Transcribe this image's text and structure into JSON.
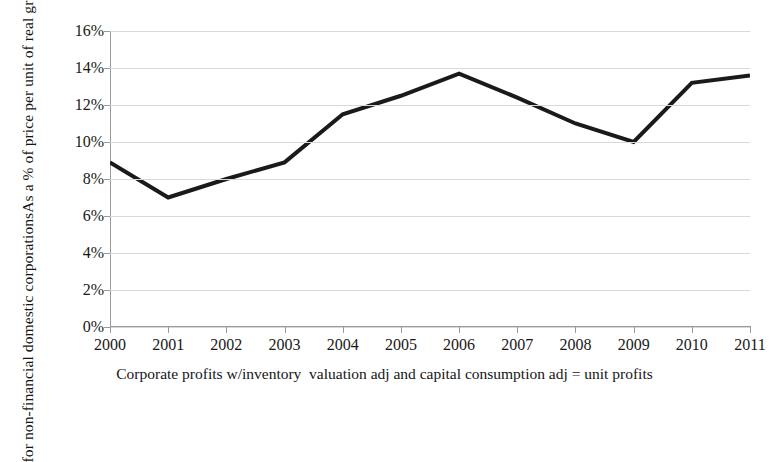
{
  "chart_data": {
    "type": "line",
    "title": "",
    "subtitle": "",
    "xlabel": "Corporate profits w/inventory  valuation adj and capital consumption adj = unit profits",
    "ylabel_line1": "As a % of price per unit of real gross value-added",
    "ylabel_line2": "for non-financial domestic corporations",
    "categories": [
      "2000",
      "2001",
      "2002",
      "2003",
      "2004",
      "2005",
      "2006",
      "2007",
      "2008",
      "2009",
      "2010",
      "2011"
    ],
    "x": [
      2000,
      2001,
      2002,
      2003,
      2004,
      2005,
      2006,
      2007,
      2008,
      2009,
      2010,
      2011
    ],
    "values": [
      8.9,
      7.0,
      8.0,
      8.9,
      11.5,
      12.5,
      13.7,
      12.4,
      11.0,
      10.0,
      13.2,
      13.6
    ],
    "series": [
      {
        "name": "unit profits",
        "values": [
          8.9,
          7.0,
          8.0,
          8.9,
          11.5,
          12.5,
          13.7,
          12.4,
          11.0,
          10.0,
          13.2,
          13.6
        ],
        "color": "#1a1a1a",
        "line_width": 4
      }
    ],
    "ylim": [
      0,
      16
    ],
    "xlim": [
      2000,
      2011
    ],
    "ytick_labels": [
      "0%",
      "2%",
      "4%",
      "6%",
      "8%",
      "10%",
      "12%",
      "14%",
      "16%"
    ],
    "ytick_values": [
      0,
      2,
      4,
      6,
      8,
      10,
      12,
      14,
      16
    ],
    "xtick_labels": [
      "2000",
      "2001",
      "2002",
      "2003",
      "2004",
      "2005",
      "2006",
      "2007",
      "2008",
      "2009",
      "2010",
      "2011"
    ],
    "grid": "horizontal",
    "grid_color": "#d8d8d8",
    "axis_color": "#9a9a9a",
    "legend": "none",
    "legend_position": "none",
    "annotations": [],
    "background": "#ffffff"
  }
}
